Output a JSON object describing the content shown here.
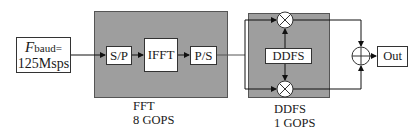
{
  "input": {
    "symbol": "F",
    "subscript": "baud",
    "equals": "=",
    "value": "125Msps"
  },
  "fft_block": {
    "blocks": [
      {
        "label": "S/P"
      },
      {
        "label": "IFFT"
      },
      {
        "label": "P/S"
      }
    ],
    "name": "FFT",
    "ops": "8 GOPS",
    "fill_color": "#9e9e9e"
  },
  "ddfs_block": {
    "inner_label": "DDFS",
    "name": "DDFS",
    "ops": "1 GOPS",
    "multiplier_symbol": "⊗",
    "fill_color": "#9e9e9e"
  },
  "adder": {
    "symbol": "⊕"
  },
  "output": {
    "label": "Out"
  }
}
